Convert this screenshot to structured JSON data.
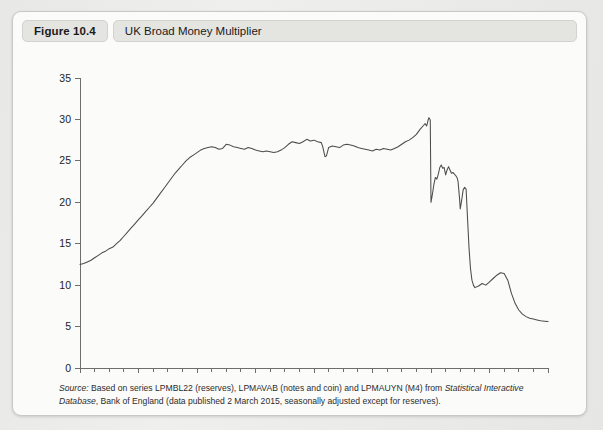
{
  "figure": {
    "badge_label": "Figure 10.4",
    "title": "UK Broad Money Multiplier"
  },
  "source": {
    "label": "Source:",
    "text_part_1": " Based on series LPMBL22 (reserves), LPMAVAB (notes and coin) and LPMAUYN (M4) from ",
    "italic_part": "Statistical Interactive Database",
    "text_part_2": ", Bank of England (data published 2 March 2015, seasonally adjusted except for reserves)."
  },
  "colors": {
    "line": "#4c4c4c",
    "axis": "#6e6e6e",
    "plot_background": "#ffffff",
    "frame_background": "#fbfbfa",
    "header_badge": "#e4e4e1"
  },
  "chart_data": {
    "type": "line",
    "title": "UK Broad Money Multiplier",
    "xlabel": "",
    "ylabel": "",
    "xlim": [
      1983,
      2015
    ],
    "ylim": [
      0,
      35
    ],
    "ytick_values": [
      0,
      5,
      10,
      15,
      20,
      25,
      30,
      35
    ],
    "xtick_labels": [
      "1983",
      "1987",
      "1991",
      "1995",
      "1999",
      "2003",
      "2007",
      "2011",
      "2015"
    ],
    "xtick_values": [
      1983,
      1987,
      1991,
      1995,
      1999,
      2003,
      2007,
      2011,
      2015
    ],
    "minor_xticks_every_years": 1,
    "grid": false,
    "legend": false,
    "series": [
      {
        "name": "UK broad money multiplier",
        "x": [
          1983.0,
          1983.25,
          1983.5,
          1983.75,
          1984.0,
          1984.25,
          1984.5,
          1984.75,
          1985.0,
          1985.25,
          1985.5,
          1985.75,
          1986.0,
          1986.25,
          1986.5,
          1986.75,
          1987.0,
          1987.25,
          1987.5,
          1987.75,
          1988.0,
          1988.25,
          1988.5,
          1988.75,
          1989.0,
          1989.25,
          1989.5,
          1989.75,
          1990.0,
          1990.25,
          1990.5,
          1990.75,
          1991.0,
          1991.25,
          1991.5,
          1991.75,
          1992.0,
          1992.25,
          1992.5,
          1992.75,
          1993.0,
          1993.25,
          1993.5,
          1993.75,
          1994.0,
          1994.25,
          1994.5,
          1994.75,
          1995.0,
          1995.25,
          1995.5,
          1995.75,
          1996.0,
          1996.25,
          1996.5,
          1996.75,
          1997.0,
          1997.25,
          1997.5,
          1997.75,
          1998.0,
          1998.25,
          1998.5,
          1998.75,
          1999.0,
          1999.25,
          1999.5,
          1999.6,
          1999.75,
          1999.85,
          2000.0,
          2000.25,
          2000.5,
          2000.75,
          2001.0,
          2001.25,
          2001.5,
          2001.75,
          2002.0,
          2002.25,
          2002.5,
          2002.75,
          2003.0,
          2003.25,
          2003.5,
          2003.75,
          2004.0,
          2004.25,
          2004.5,
          2004.75,
          2005.0,
          2005.25,
          2005.5,
          2005.75,
          2006.0,
          2006.25,
          2006.5,
          2006.6,
          2006.7,
          2006.75,
          2006.8,
          2006.85,
          2006.9,
          2006.95,
          2007.0,
          2007.1,
          2007.2,
          2007.3,
          2007.4,
          2007.5,
          2007.6,
          2007.7,
          2007.8,
          2007.9,
          2008.0,
          2008.1,
          2008.2,
          2008.3,
          2008.4,
          2008.5,
          2008.6,
          2008.7,
          2008.8,
          2008.85,
          2008.9,
          2008.95,
          2009.0,
          2009.1,
          2009.2,
          2009.3,
          2009.4,
          2009.5,
          2009.6,
          2009.7,
          2009.8,
          2009.9,
          2010.0,
          2010.25,
          2010.5,
          2010.75,
          2011.0,
          2011.25,
          2011.5,
          2011.75,
          2012.0,
          2012.25,
          2012.5,
          2012.75,
          2013.0,
          2013.25,
          2013.5,
          2013.75,
          2014.0,
          2014.25,
          2014.5,
          2014.75,
          2015.0
        ],
        "y": [
          12.5,
          12.6,
          12.8,
          13.0,
          13.3,
          13.6,
          13.9,
          14.1,
          14.4,
          14.6,
          15.0,
          15.4,
          15.9,
          16.4,
          16.9,
          17.4,
          17.9,
          18.4,
          18.9,
          19.4,
          19.9,
          20.5,
          21.1,
          21.7,
          22.3,
          22.9,
          23.5,
          24.0,
          24.5,
          25.0,
          25.4,
          25.7,
          26.0,
          26.3,
          26.5,
          26.6,
          26.7,
          26.6,
          26.4,
          26.5,
          27.0,
          26.9,
          26.7,
          26.6,
          26.5,
          26.4,
          26.6,
          26.5,
          26.3,
          26.2,
          26.1,
          26.2,
          26.1,
          26.0,
          26.1,
          26.3,
          26.6,
          27.0,
          27.3,
          27.2,
          27.1,
          27.3,
          27.6,
          27.4,
          27.5,
          27.3,
          27.2,
          26.7,
          25.5,
          25.6,
          26.6,
          26.8,
          26.7,
          26.6,
          26.9,
          27.0,
          26.9,
          26.8,
          26.6,
          26.5,
          26.4,
          26.3,
          26.2,
          26.4,
          26.3,
          26.5,
          26.4,
          26.3,
          26.5,
          26.7,
          27.0,
          27.3,
          27.5,
          27.8,
          28.2,
          28.8,
          29.3,
          29.5,
          29.2,
          29.5,
          29.9,
          30.2,
          30.1,
          29.9,
          20.0,
          21.0,
          22.2,
          23.0,
          22.8,
          23.4,
          24.2,
          24.5,
          24.1,
          24.2,
          23.3,
          23.9,
          24.3,
          23.9,
          23.5,
          23.6,
          23.4,
          23.2,
          22.9,
          22.5,
          21.5,
          20.5,
          19.2,
          20.3,
          21.5,
          21.8,
          21.6,
          18.0,
          14.5,
          12.0,
          10.6,
          10.0,
          9.7,
          9.9,
          10.2,
          10.0,
          10.4,
          10.8,
          11.2,
          11.5,
          11.4,
          10.6,
          9.0,
          7.8,
          7.0,
          6.5,
          6.2,
          6.0,
          5.9,
          5.8,
          5.7,
          5.65,
          5.6
        ]
      }
    ]
  }
}
